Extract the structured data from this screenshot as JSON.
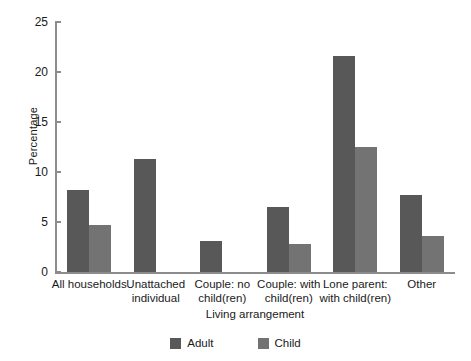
{
  "chart_data": {
    "type": "bar",
    "title": "",
    "subtitle": "",
    "xlabel": "Living arrangement",
    "ylabel": "Percentage",
    "ylim": [
      0,
      25
    ],
    "yticks": [
      0,
      5,
      10,
      15,
      20,
      25
    ],
    "grid": false,
    "legend_position": "bottom-center",
    "categories": [
      "All households",
      "Unattached individual",
      "Couple: no child(ren)",
      "Couple: with child(ren)",
      "Lone parent: with child(ren)",
      "Other"
    ],
    "series": [
      {
        "name": "Adult",
        "color": "#585858",
        "values": [
          8.2,
          11.3,
          3.1,
          6.5,
          21.6,
          7.7
        ]
      },
      {
        "name": "Child",
        "color": "#737373",
        "values": [
          4.7,
          0,
          0,
          2.8,
          12.5,
          3.6
        ]
      }
    ]
  },
  "axes": {
    "y_title": "Percentage",
    "x_title": "Living arrangement",
    "y_tick_labels": [
      "0",
      "5",
      "10",
      "15",
      "20",
      "25"
    ]
  },
  "legend": {
    "items": [
      {
        "label": "Adult",
        "color": "#585858"
      },
      {
        "label": "Child",
        "color": "#737373"
      }
    ]
  },
  "category_labels": [
    {
      "lines": [
        "All households"
      ]
    },
    {
      "lines": [
        "Unattached",
        "individual"
      ]
    },
    {
      "lines": [
        "Couple: no",
        "child(ren)"
      ]
    },
    {
      "lines": [
        "Couple: with",
        "child(ren)"
      ]
    },
    {
      "lines": [
        "Lone parent:",
        "with child(ren)"
      ]
    },
    {
      "lines": [
        "Other"
      ]
    }
  ],
  "colors": {
    "adult": "#585858",
    "child": "#737373",
    "axis": "#8c8c8c",
    "text": "#1a1a1a",
    "background": "#ffffff"
  }
}
